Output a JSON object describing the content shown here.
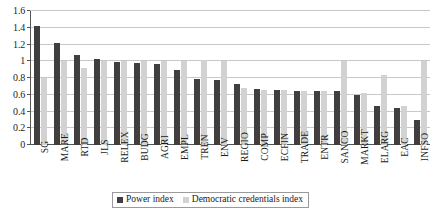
{
  "chart_data": {
    "type": "bar",
    "title": "",
    "xlabel": "",
    "ylabel": "",
    "ylim": [
      0,
      1.6
    ],
    "yticks": [
      "0",
      "0.2",
      "0.4",
      "0.6",
      "0.8",
      "1",
      "1.2",
      "1.4",
      "1.6"
    ],
    "ytick_values": [
      0,
      0.2,
      0.4,
      0.6,
      0.8,
      1.0,
      1.2,
      1.4,
      1.6
    ],
    "grid": true,
    "legend_position": "bottom",
    "categories": [
      "SG",
      "MARE",
      "RTD",
      "JLS",
      "RELEX",
      "BUDG",
      "AGRI",
      "EMPL",
      "TREN",
      "ENV",
      "REGIO",
      "COMP",
      "ECFIN",
      "TRADE",
      "ENTR",
      "SANCO",
      "MARKT",
      "ELARG",
      "EAC",
      "INFSO"
    ],
    "series": [
      {
        "name": "Power index",
        "color": "#403e3f",
        "values": [
          1.42,
          1.22,
          1.08,
          1.03,
          0.99,
          0.98,
          0.97,
          0.9,
          0.79,
          0.78,
          0.73,
          0.67,
          0.66,
          0.64,
          0.64,
          0.64,
          0.6,
          0.47,
          0.44,
          0.3
        ]
      },
      {
        "name": "Democratic credentials index",
        "color": "#d2d2d2",
        "values": [
          0.8,
          1.0,
          0.92,
          1.0,
          1.0,
          1.0,
          1.0,
          1.0,
          1.02,
          1.0,
          0.68,
          0.66,
          0.66,
          0.64,
          0.65,
          1.0,
          0.62,
          0.84,
          0.47,
          1.0
        ]
      }
    ]
  },
  "legend": {
    "items": [
      {
        "label": "Power index",
        "key": "power"
      },
      {
        "label": "Democratic credentials index",
        "key": "democratic"
      }
    ]
  }
}
